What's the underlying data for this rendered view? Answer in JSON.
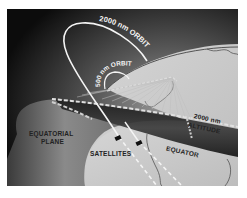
{
  "diagram": {
    "labels": {
      "orbit_2000": "2000 nm ORBIT",
      "orbit_500": "500 nm ORBIT",
      "altitude_line1": "2000 nm",
      "altitude_line2": "ALTITUDE",
      "equatorial_line1": "EQUATORIAL",
      "equatorial_line2": "PLANE",
      "satellites": "SATELLITES",
      "equator": "EQUATOR"
    },
    "colors": {
      "space": "#0e0e0e",
      "earth": "#c9c9c9",
      "band": "#2a2a2a",
      "orbit_line": "#f4f4f4",
      "text_dark": "#222222",
      "text_light": "#f0f0f0"
    }
  }
}
